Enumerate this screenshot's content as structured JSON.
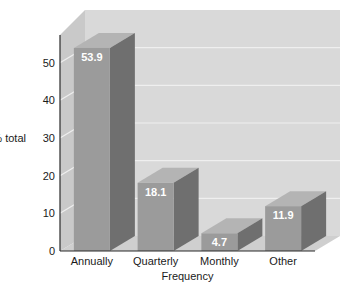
{
  "chart_data": {
    "type": "bar",
    "title": "",
    "subtitle": "",
    "xlabel": "Frequency",
    "ylabel": "% total",
    "categories": [
      "Annually",
      "Quarterly",
      "Monthly",
      "Other"
    ],
    "values": [
      53.9,
      18.1,
      4.7,
      11.9
    ],
    "value_labels": [
      "53.9",
      "18.1",
      "4.7",
      "11.9"
    ],
    "yticks": [
      0,
      10,
      20,
      30,
      40,
      50
    ],
    "ytick_labels": [
      "0",
      "10",
      "20",
      "30",
      "40",
      "50"
    ],
    "ylim": [
      0,
      60
    ],
    "grid": true,
    "grid_axis": "y",
    "legend": "none",
    "style": "3d-column",
    "colors": {
      "bar_front": "#9b9b9b",
      "bar_side": "#6f6f6f",
      "bar_top": "#b4b4b4",
      "back_wall": "#d9d9d9",
      "left_wall": "#c9c9c9",
      "floor": "#cfcfcf",
      "grid_line": "#efefef",
      "axis": "#2a2a2a",
      "value_text": "#ffffff",
      "text": "#1a1a1a"
    }
  }
}
